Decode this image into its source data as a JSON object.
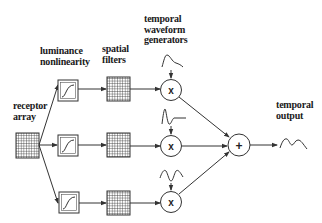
{
  "diagram": {
    "type": "block-diagram",
    "labels": {
      "receptor_array": [
        "receptor",
        "array"
      ],
      "luminance_nonlinearity": [
        "luminance",
        "nonlinearity"
      ],
      "spatial_filters": [
        "spatial",
        "filters"
      ],
      "temporal_waveform_generators": [
        "temporal",
        "waveform",
        "generators"
      ],
      "temporal_output": [
        "temporal",
        "output"
      ]
    },
    "operators": {
      "multiply": "x",
      "sum": "+"
    },
    "channels": [
      {
        "name": "channel-1",
        "waveform": "slow rise, gradual decay"
      },
      {
        "name": "channel-2",
        "waveform": "sharp transient, dip, flat"
      },
      {
        "name": "channel-3",
        "waveform": "biphasic wave with central dip"
      }
    ],
    "colors": {
      "line": "#333333",
      "grid": "#444444",
      "box_fill": "#ffffff",
      "text": "#1a1a1a"
    }
  }
}
